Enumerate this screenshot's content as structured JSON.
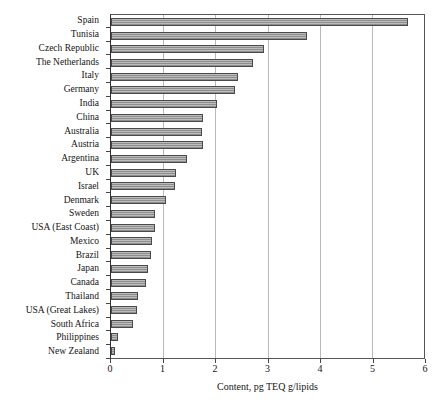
{
  "chart_data": {
    "type": "bar",
    "orientation": "horizontal",
    "title": "",
    "xlabel": "Content, pg TEQ g/lipids",
    "ylabel": "",
    "xlim": [
      0,
      6
    ],
    "xticks": [
      0,
      1,
      2,
      3,
      4,
      5,
      6
    ],
    "xtick_labels": [
      "0",
      "1",
      "2",
      "3",
      "4",
      "5",
      "6"
    ],
    "grid": "vertical",
    "legend": "none",
    "bar_color": "#8d8d8d",
    "bar_edge_color": "#4a4a4a",
    "categories": [
      "Spain",
      "Tunisia",
      "Czech Republic",
      "The Netherlands",
      "Italy",
      "Germany",
      "India",
      "China",
      "Australia",
      "Austria",
      "Argentina",
      "UK",
      "Israel",
      "Denmark",
      "Sweden",
      "USA (East Coast)",
      "Mexico",
      "Brazil",
      "Japan",
      "Canada",
      "Thailand",
      "USA (Great Lakes)",
      "South Africa",
      "Philippines",
      "New Zealand"
    ],
    "values": [
      5.7,
      3.75,
      2.93,
      2.72,
      2.43,
      2.37,
      2.03,
      1.76,
      1.75,
      1.76,
      1.45,
      1.24,
      1.23,
      1.06,
      0.85,
      0.85,
      0.79,
      0.76,
      0.7,
      0.68,
      0.51,
      0.5,
      0.43,
      0.13,
      0.07
    ]
  }
}
